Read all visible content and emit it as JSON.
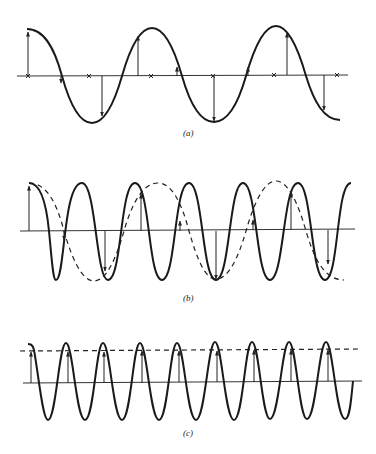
{
  "figure": {
    "type": "aliasing-illustration",
    "panels": [
      {
        "id": "a",
        "label": "(a)",
        "description": "Sinusoid sampled at more than twice its frequency; sample arrows and zero-crossing x marks",
        "signal_cycles": 2.7,
        "samples_per_cycle": 4,
        "has_x_markers": true,
        "has_dashed_alias": false
      },
      {
        "id": "b",
        "label": "(b)",
        "description": "Higher-frequency sinusoid (solid) sampled below Nyquist; samples fit a lower-frequency alias (dashed)",
        "signal_cycles": 6.2,
        "alias_cycles": 2.7,
        "has_x_markers": false,
        "has_dashed_alias": true
      },
      {
        "id": "c",
        "label": "(c)",
        "description": "Sinusoid sampled once per cycle; all samples equal, alias is a constant (dashed horizontal line)",
        "signal_cycles": 9,
        "samples_per_cycle": 1,
        "has_x_markers": false,
        "has_dashed_alias": true
      }
    ]
  }
}
